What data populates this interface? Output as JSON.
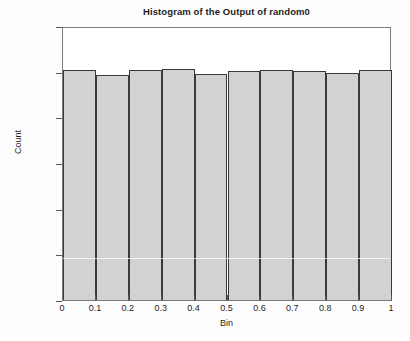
{
  "chart_data": {
    "type": "bar",
    "title": "Histogram of the Output of random0",
    "xlabel": "Bin",
    "ylabel": "Count",
    "categories": [
      "0-0.1",
      "0.1-0.2",
      "0.2-0.3",
      "0.3-0.4",
      "0.4-0.5",
      "0.5-0.6",
      "0.6-0.7",
      "0.7-0.8",
      "0.8-0.9",
      "0.9-1"
    ],
    "bin_edges": [
      0,
      0.1,
      0.2,
      0.3,
      0.4,
      0.5,
      0.6,
      0.7,
      0.8,
      0.9,
      1
    ],
    "values": [
      10080,
      9840,
      10070,
      10120,
      9920,
      10010,
      10080,
      10040,
      9930,
      10080
    ],
    "xlim": [
      0,
      1
    ],
    "ylim": [
      0,
      12000
    ],
    "xticks": [
      "0",
      "0.1",
      "0.2",
      "0.3",
      "0.4",
      "0.5",
      "0.6",
      "0.7",
      "0.8",
      "0.9",
      "1"
    ],
    "xtick_values": [
      0,
      0.1,
      0.2,
      0.3,
      0.4,
      0.5,
      0.6,
      0.7,
      0.8,
      0.9,
      1
    ],
    "yticks": [
      "0",
      "2000",
      "4000",
      "6000",
      "8000",
      "10000",
      "12000"
    ],
    "ytick_values": [
      0,
      2000,
      4000,
      6000,
      8000,
      10000,
      12000
    ],
    "grid": false,
    "legend": null,
    "bar_fill_color": "#d2d2d2",
    "bar_edge_color": "#3a3a3a",
    "axis_color": "#7a7a7a",
    "text_color": "#1d1d1d",
    "background_color": "#ffffff"
  }
}
